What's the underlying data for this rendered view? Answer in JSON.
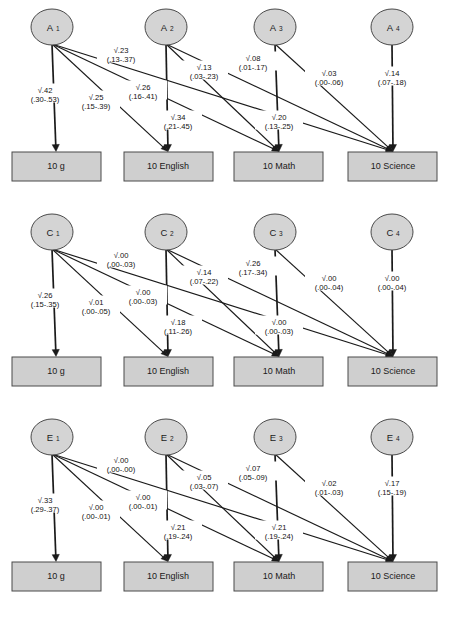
{
  "figure": {
    "type": "path-diagram",
    "outcome_boxes": [
      "10 g",
      "10 English",
      "10 Math",
      "10 Science"
    ],
    "panels": [
      {
        "id": "panel-a",
        "component": "A",
        "latents": [
          "A",
          "A",
          "A",
          "A"
        ],
        "latent_labels": [
          "A₁",
          "A₂",
          "A₃",
          "A₄"
        ],
        "latent_base": "A",
        "latent_subs": [
          "1",
          "2",
          "3",
          "4"
        ],
        "paths": [
          {
            "from": 0,
            "to": 0,
            "estimate": "√.42",
            "ci": "(.30-.53)"
          },
          {
            "from": 0,
            "to": 1,
            "estimate": "√.25",
            "ci": "(.15-.39)"
          },
          {
            "from": 0,
            "to": 2,
            "estimate": "√.23",
            "ci": "(.13-.37)"
          },
          {
            "from": 0,
            "to": 3,
            "estimate": "√.26",
            "ci": "(.16-.41)"
          },
          {
            "from": 1,
            "to": 1,
            "estimate": "√.34",
            "ci": "(.21-.45)"
          },
          {
            "from": 1,
            "to": 2,
            "estimate": "√.13",
            "ci": "(.03-.23)"
          },
          {
            "from": 1,
            "to": 3,
            "estimate": "√.08",
            "ci": "(.01-.17)"
          },
          {
            "from": 2,
            "to": 2,
            "estimate": "√.20",
            "ci": "(.13-.25)"
          },
          {
            "from": 2,
            "to": 3,
            "estimate": "√.03",
            "ci": "(.00-.06)"
          },
          {
            "from": 3,
            "to": 3,
            "estimate": "√.14",
            "ci": "(.07-.18)"
          }
        ],
        "labels": [
          {
            "estimate": "√.23",
            "ci": "(.13-.37)",
            "x": 121,
            "y": 53
          },
          {
            "estimate": "√.13",
            "ci": "(.03-.23)",
            "x": 204,
            "y": 70
          },
          {
            "estimate": "√.08",
            "ci": "(.01-.17)",
            "x": 253,
            "y": 61
          },
          {
            "estimate": "√.03",
            "ci": "(.00-.06)",
            "x": 329,
            "y": 76
          },
          {
            "estimate": "√.14",
            "ci": "(.07-.18)",
            "x": 392,
            "y": 76
          },
          {
            "estimate": "√.42",
            "ci": "(.30-.53)",
            "x": 45,
            "y": 93
          },
          {
            "estimate": "√.25",
            "ci": "(.15-.39)",
            "x": 96,
            "y": 100
          },
          {
            "estimate": "√.26",
            "ci": "(.16-.41)",
            "x": 143,
            "y": 90
          },
          {
            "estimate": "√.34",
            "ci": "(.21-.45)",
            "x": 178,
            "y": 120
          },
          {
            "estimate": "√.20",
            "ci": "(.13-.25)",
            "x": 279,
            "y": 120
          }
        ]
      },
      {
        "id": "panel-c",
        "component": "C",
        "latent_labels": [
          "C₁",
          "C₂",
          "C₃",
          "C₄"
        ],
        "latent_base": "C",
        "latent_subs": [
          "1",
          "2",
          "3",
          "4"
        ],
        "paths": [
          {
            "from": 0,
            "to": 0,
            "estimate": "√.26",
            "ci": "(.15-.35)"
          },
          {
            "from": 0,
            "to": 1,
            "estimate": "√.01",
            "ci": "(.00-.05)"
          },
          {
            "from": 0,
            "to": 2,
            "estimate": "√.00",
            "ci": "(.00-.03)"
          },
          {
            "from": 0,
            "to": 3,
            "estimate": "√.00",
            "ci": "(.00-.03)"
          },
          {
            "from": 1,
            "to": 1,
            "estimate": "√.18",
            "ci": "(.11-.26)"
          },
          {
            "from": 1,
            "to": 2,
            "estimate": "√.14",
            "ci": "(.07-.22)"
          },
          {
            "from": 1,
            "to": 3,
            "estimate": "√.26",
            "ci": "(.17-.34)"
          },
          {
            "from": 2,
            "to": 2,
            "estimate": "√.00",
            "ci": "(.00-.03)"
          },
          {
            "from": 2,
            "to": 3,
            "estimate": "√.00",
            "ci": "(.00-.04)"
          },
          {
            "from": 3,
            "to": 3,
            "estimate": "√.00",
            "ci": "(.00-.04)"
          }
        ],
        "labels": [
          {
            "estimate": "√.00",
            "ci": "(.00-.03)",
            "x": 121,
            "y": 53
          },
          {
            "estimate": "√.14",
            "ci": "(.07-.22)",
            "x": 204,
            "y": 70
          },
          {
            "estimate": "√.26",
            "ci": "(.17-.34)",
            "x": 253,
            "y": 61
          },
          {
            "estimate": "√.00",
            "ci": "(.00-.04)",
            "x": 329,
            "y": 76
          },
          {
            "estimate": "√.00",
            "ci": "(.00-.04)",
            "x": 392,
            "y": 76
          },
          {
            "estimate": "√.26",
            "ci": "(.15-.35)",
            "x": 45,
            "y": 93
          },
          {
            "estimate": "√.01",
            "ci": "(.00-.05)",
            "x": 96,
            "y": 100
          },
          {
            "estimate": "√.00",
            "ci": "(.00-.03)",
            "x": 143,
            "y": 90
          },
          {
            "estimate": "√.18",
            "ci": "(.11-.26)",
            "x": 178,
            "y": 120
          },
          {
            "estimate": "√.00",
            "ci": "(.00-.03)",
            "x": 279,
            "y": 120
          }
        ]
      },
      {
        "id": "panel-e",
        "component": "E",
        "latent_labels": [
          "E₁",
          "E₂",
          "E₃",
          "E₄"
        ],
        "latent_base": "E",
        "latent_subs": [
          "1",
          "2",
          "3",
          "4"
        ],
        "paths": [
          {
            "from": 0,
            "to": 0,
            "estimate": "√.33",
            "ci": "(.29-.37)"
          },
          {
            "from": 0,
            "to": 1,
            "estimate": "√.00",
            "ci": "(.00-.01)"
          },
          {
            "from": 0,
            "to": 2,
            "estimate": "√.00",
            "ci": "(.00-.00)"
          },
          {
            "from": 0,
            "to": 3,
            "estimate": "√.00",
            "ci": "(.00-.01)"
          },
          {
            "from": 1,
            "to": 1,
            "estimate": "√.21",
            "ci": "(.19-.24)"
          },
          {
            "from": 1,
            "to": 2,
            "estimate": "√.05",
            "ci": "(.03-.07)"
          },
          {
            "from": 1,
            "to": 3,
            "estimate": "√.07",
            "ci": "(.05-.09)"
          },
          {
            "from": 2,
            "to": 2,
            "estimate": "√.21",
            "ci": "(.19-.24)"
          },
          {
            "from": 2,
            "to": 3,
            "estimate": "√.02",
            "ci": "(.01-.03)"
          },
          {
            "from": 3,
            "to": 3,
            "estimate": "√.17",
            "ci": "(.15-.19)"
          }
        ],
        "labels": [
          {
            "estimate": "√.00",
            "ci": "(.00-.00)",
            "x": 121,
            "y": 53
          },
          {
            "estimate": "√.05",
            "ci": "(.03-.07)",
            "x": 204,
            "y": 70
          },
          {
            "estimate": "√.07",
            "ci": "(.05-.09)",
            "x": 253,
            "y": 61
          },
          {
            "estimate": "√.02",
            "ci": "(.01-.03)",
            "x": 329,
            "y": 76
          },
          {
            "estimate": "√.17",
            "ci": "(.15-.19)",
            "x": 392,
            "y": 76
          },
          {
            "estimate": "√.33",
            "ci": "(.29-.37)",
            "x": 45,
            "y": 93
          },
          {
            "estimate": "√.00",
            "ci": "(.00-.01)",
            "x": 96,
            "y": 100
          },
          {
            "estimate": "√.00",
            "ci": "(.00-.01)",
            "x": 143,
            "y": 90
          },
          {
            "estimate": "√.21",
            "ci": "(.19-.24)",
            "x": 178,
            "y": 120
          },
          {
            "estimate": "√.21",
            "ci": "(.19-.24)",
            "x": 279,
            "y": 120
          }
        ]
      }
    ],
    "geometry": {
      "ellipse_cx": [
        52,
        166,
        275,
        392
      ],
      "ellipse_cy": 27,
      "ellipse_rx": 21,
      "ellipse_ry": 18,
      "box_x": [
        12,
        124,
        234,
        348
      ],
      "box_y": 152,
      "box_w": 89,
      "box_h": 29,
      "box_cx": [
        56,
        168,
        279,
        393
      ]
    },
    "colors": {
      "node_fill": "#d4d4d4",
      "node_stroke": "#4a4a4a",
      "box_fill": "#cfcfcf",
      "box_stroke": "#4a4a4a",
      "edge": "#1a1a1a",
      "text": "#111111",
      "background": "#ffffff"
    }
  }
}
